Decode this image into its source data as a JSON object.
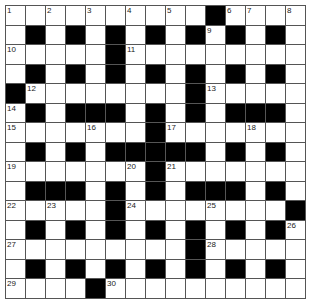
{
  "puzzle": {
    "rows": 15,
    "cols": 15,
    "colors": {
      "black": "#000000",
      "white": "#ffffff",
      "grid_line": "#555555"
    },
    "layout": [
      "..........#....",
      ".#.#.#.#.#.#.#.",
      ".....#.........",
      ".#.#.#.#.#.#.#.",
      "#........#.....",
      ".#.###.#.#.###.",
      ".......#.......",
      ".#.#.#####.#.#.",
      ".......#.......",
      ".###.#.#.###.#.",
      ".....#........#",
      ".#.#.#.#.#.#.#.",
      ".........#.....",
      ".#.#.#.#.#.#.#.",
      "....#.........."
    ],
    "numbers": [
      {
        "n": "1",
        "r": 0,
        "c": 0
      },
      {
        "n": "2",
        "r": 0,
        "c": 2
      },
      {
        "n": "3",
        "r": 0,
        "c": 4
      },
      {
        "n": "4",
        "r": 0,
        "c": 6
      },
      {
        "n": "5",
        "r": 0,
        "c": 8
      },
      {
        "n": "6",
        "r": 0,
        "c": 11
      },
      {
        "n": "7",
        "r": 0,
        "c": 12
      },
      {
        "n": "8",
        "r": 0,
        "c": 14
      },
      {
        "n": "9",
        "r": 1,
        "c": 10
      },
      {
        "n": "10",
        "r": 2,
        "c": 0
      },
      {
        "n": "11",
        "r": 2,
        "c": 6
      },
      {
        "n": "12",
        "r": 4,
        "c": 1
      },
      {
        "n": "13",
        "r": 4,
        "c": 10
      },
      {
        "n": "14",
        "r": 5,
        "c": 0
      },
      {
        "n": "15",
        "r": 6,
        "c": 0
      },
      {
        "n": "16",
        "r": 6,
        "c": 4
      },
      {
        "n": "17",
        "r": 6,
        "c": 8
      },
      {
        "n": "18",
        "r": 6,
        "c": 12
      },
      {
        "n": "19",
        "r": 8,
        "c": 0
      },
      {
        "n": "20",
        "r": 8,
        "c": 6
      },
      {
        "n": "21",
        "r": 8,
        "c": 8
      },
      {
        "n": "22",
        "r": 10,
        "c": 0
      },
      {
        "n": "23",
        "r": 10,
        "c": 2
      },
      {
        "n": "24",
        "r": 10,
        "c": 6
      },
      {
        "n": "25",
        "r": 10,
        "c": 10
      },
      {
        "n": "26",
        "r": 11,
        "c": 14
      },
      {
        "n": "27",
        "r": 12,
        "c": 0
      },
      {
        "n": "28",
        "r": 12,
        "c": 10
      },
      {
        "n": "29",
        "r": 14,
        "c": 0
      },
      {
        "n": "30",
        "r": 14,
        "c": 5
      }
    ]
  }
}
